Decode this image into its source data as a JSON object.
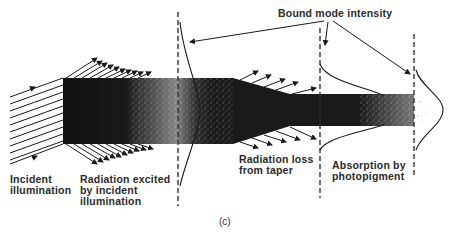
{
  "title": "Bound mode intensity",
  "labels": {
    "incident": "Incident\nillumination",
    "radiation_excited": "Radiation excited\nby incident\nillumination",
    "radiation_loss": "Radiation loss\nfrom taper",
    "absorption": "Absorption by\nphotopigment",
    "panel": "(c)"
  },
  "colors": {
    "ink": "#1a1a1a",
    "background": "#ffffff"
  },
  "geometry": {
    "dashed_lines_x": [
      178,
      320,
      414
    ],
    "wide_segment": {
      "x": 63,
      "top": 78,
      "bottom": 144
    },
    "narrow_segment": {
      "top": 94,
      "bottom": 126,
      "end_x": 414
    }
  }
}
